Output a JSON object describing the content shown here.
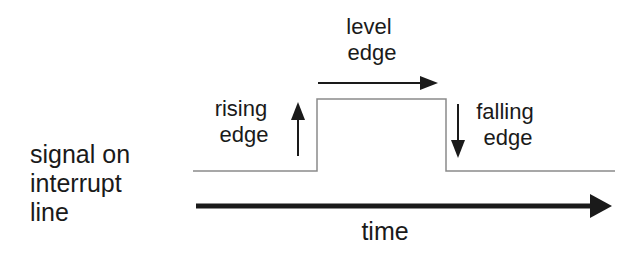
{
  "labels": {
    "level_edge": [
      "level",
      "edge"
    ],
    "rising_edge": [
      "rising",
      "edge"
    ],
    "falling_edge": [
      "falling",
      "edge"
    ],
    "signal": [
      "signal on",
      "interrupt",
      "line"
    ],
    "time": "time"
  },
  "colors": {
    "ink": "#1a1a1a",
    "signal_line": "#8a8a8a",
    "background": "#ffffff"
  }
}
